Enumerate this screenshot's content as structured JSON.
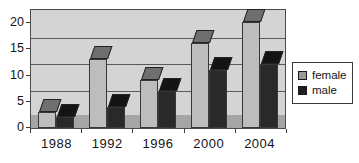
{
  "chart_data": {
    "type": "bar",
    "variant": "3d-clustered-column",
    "categories": [
      "1988",
      "1992",
      "1996",
      "2000",
      "2004"
    ],
    "series": [
      {
        "name": "female",
        "values": [
          3,
          13,
          9,
          16,
          20
        ],
        "legend_fill": "#9a9a9a",
        "front_fill": "#bdbdbd",
        "top_fill": "#6f6f6f"
      },
      {
        "name": "male",
        "values": [
          2,
          4,
          7,
          11,
          12
        ],
        "legend_fill": "#1f1f1f",
        "front_fill": "#292929",
        "top_fill": "#141414"
      }
    ],
    "ylim": [
      0,
      20
    ],
    "y_ticks": [
      0,
      5,
      10,
      15,
      20
    ],
    "grid": true,
    "legend_position": "right",
    "colors": {
      "wall": "#d4d4d4",
      "floor": "#a5a5a5",
      "gridline": "#5a5a5a",
      "axis": "#3f3f3f",
      "text": "#141414",
      "legend_bg": "#ffffff"
    }
  }
}
